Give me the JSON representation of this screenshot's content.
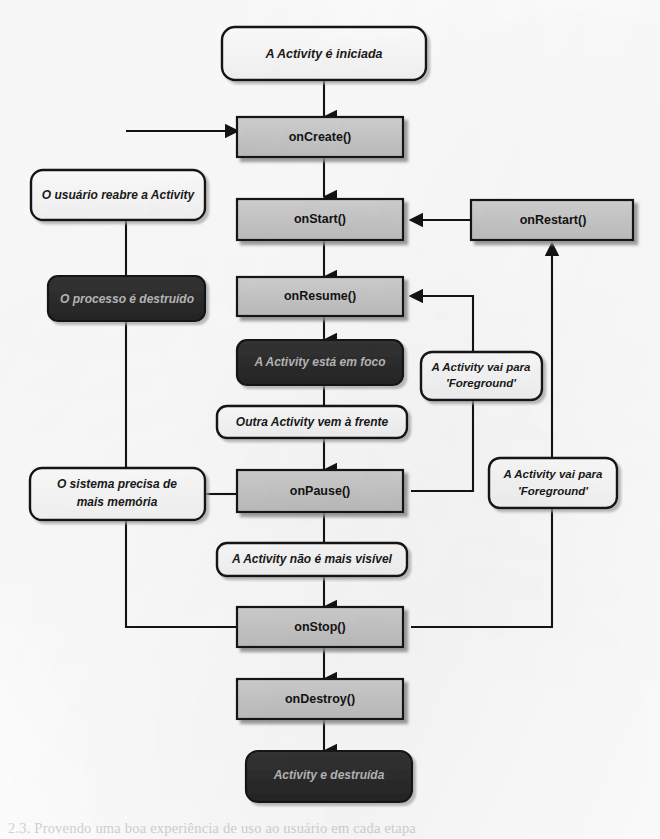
{
  "diagram": {
    "language": "pt-BR",
    "colors": {
      "page_background": "#fdfdfd",
      "method_box_fill": "#c9c9c9",
      "state_box_fill": "#fbfbfb",
      "terminal_box_fill": "#2e2e2e",
      "terminal_text": "#b9b9b9",
      "stroke": "#141414",
      "shadow": "#a8a8a8"
    },
    "nodes": [
      {
        "id": "start",
        "label": "A Activity é iniciada",
        "kind": "state",
        "shape": "rounded"
      },
      {
        "id": "oncreate",
        "label": "onCreate()",
        "kind": "method",
        "shape": "rect"
      },
      {
        "id": "reopen",
        "label": "O usuário reabre a Activity",
        "kind": "state",
        "shape": "rounded"
      },
      {
        "id": "onstart",
        "label": "onStart()",
        "kind": "method",
        "shape": "rect"
      },
      {
        "id": "onrestart",
        "label": "onRestart()",
        "kind": "method",
        "shape": "rect"
      },
      {
        "id": "killed",
        "label": "O processo é destruído",
        "kind": "terminal",
        "shape": "rounded"
      },
      {
        "id": "onresume",
        "label": "onResume()",
        "kind": "method",
        "shape": "rect"
      },
      {
        "id": "running",
        "label": "A Activity está em foco",
        "kind": "terminal",
        "shape": "rounded"
      },
      {
        "id": "fg1_line1",
        "label": "A Activity vai para",
        "kind": "state",
        "shape": "rounded"
      },
      {
        "id": "fg1_line2",
        "label": "'Foreground'",
        "kind": "state",
        "shape": "rounded"
      },
      {
        "id": "another",
        "label": "Outra Activity vem à frente",
        "kind": "state",
        "shape": "rounded"
      },
      {
        "id": "memory_l1",
        "label": "O sistema precisa de",
        "kind": "state",
        "shape": "rounded"
      },
      {
        "id": "memory_l2",
        "label": "mais memória",
        "kind": "state",
        "shape": "rounded"
      },
      {
        "id": "onpause",
        "label": "onPause()",
        "kind": "method",
        "shape": "rect"
      },
      {
        "id": "fg2_line1",
        "label": "A Activity vai para",
        "kind": "state",
        "shape": "rounded"
      },
      {
        "id": "fg2_line2",
        "label": "'Foreground'",
        "kind": "state",
        "shape": "rounded"
      },
      {
        "id": "notvisible",
        "label": "A Activity não é mais visível",
        "kind": "state",
        "shape": "rounded"
      },
      {
        "id": "onstop",
        "label": "onStop()",
        "kind": "method",
        "shape": "rect"
      },
      {
        "id": "ondestroy",
        "label": "onDestroy()",
        "kind": "method",
        "shape": "rect"
      },
      {
        "id": "destroyed",
        "label": "Activity e destruída",
        "kind": "terminal",
        "shape": "rounded"
      }
    ],
    "edges": [
      {
        "from": "start",
        "to": "oncreate",
        "kind": "arrow-down"
      },
      {
        "from": "oncreate",
        "to": "onstart",
        "kind": "arrow-down"
      },
      {
        "from": "onstart",
        "to": "onresume",
        "kind": "arrow-down"
      },
      {
        "from": "onresume",
        "to": "running",
        "kind": "arrow-down"
      },
      {
        "from": "running",
        "to": "another",
        "kind": "line-down"
      },
      {
        "from": "another",
        "to": "onpause",
        "kind": "arrow-down"
      },
      {
        "from": "onpause",
        "to": "notvisible",
        "kind": "line-down"
      },
      {
        "from": "notvisible",
        "to": "onstop",
        "kind": "arrow-down"
      },
      {
        "from": "onstop",
        "to": "ondestroy",
        "kind": "arrow-down"
      },
      {
        "from": "ondestroy",
        "to": "destroyed",
        "kind": "arrow-down"
      },
      {
        "from": "onrestart",
        "to": "onstart",
        "kind": "arrow-left"
      },
      {
        "from": "onstop",
        "to": "onrestart",
        "kind": "arrow-up-right"
      },
      {
        "from": "onpause",
        "to": "onresume",
        "kind": "arrow-left-up"
      },
      {
        "from": "onstop",
        "to": "reopen",
        "kind": "line-left"
      },
      {
        "from": "reopen",
        "to": "oncreate",
        "kind": "arrow-right"
      },
      {
        "from": "onpause",
        "to": "memory",
        "kind": "line-left"
      }
    ],
    "caption": "2.3. Provendo uma boa experiência de uso ao usuário em cada etapa"
  }
}
